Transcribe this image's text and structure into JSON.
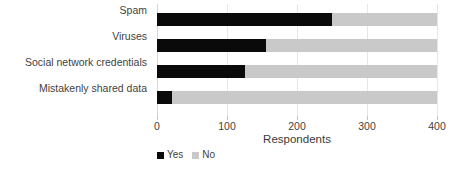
{
  "chart_data": {
    "type": "bar",
    "orientation": "horizontal",
    "stacked": true,
    "title": "",
    "xlabel": "Respondents",
    "ylabel": "",
    "xlim": [
      0,
      400
    ],
    "xticks": [
      0,
      100,
      200,
      300,
      400
    ],
    "xtick_labels": [
      "0",
      "100",
      "200",
      "300",
      "400"
    ],
    "grid": true,
    "legend_position": "bottom-left",
    "categories": [
      "Spam",
      "Viruses",
      "Social network credentials",
      "Mistakenly shared data"
    ],
    "series": [
      {
        "name": "Yes",
        "color": "#0a0a0a",
        "values": [
          250,
          155,
          125,
          22
        ]
      },
      {
        "name": "No",
        "color": "#c9c9c9",
        "values": [
          150,
          245,
          275,
          378
        ]
      }
    ]
  },
  "legend": {
    "items": [
      {
        "label": "Yes",
        "color": "#0a0a0a"
      },
      {
        "label": "No",
        "color": "#c9c9c9"
      }
    ]
  },
  "colors": {
    "yes": "#0a0a0a",
    "no": "#c9c9c9",
    "grid": "#e6e6e6",
    "text": "#3f3f3f",
    "background": "#ffffff"
  }
}
